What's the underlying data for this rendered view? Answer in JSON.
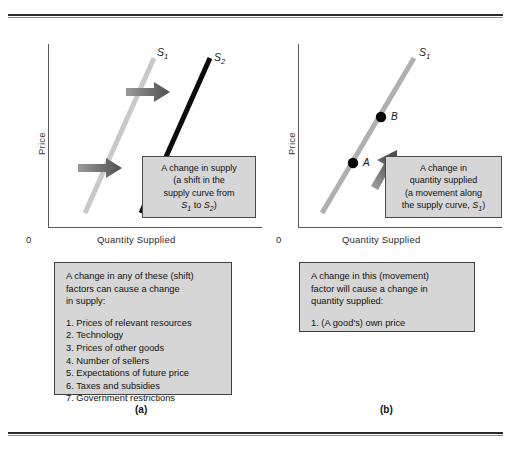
{
  "figure": {
    "panels": [
      {
        "id": "a",
        "caption": "(a)",
        "axes": {
          "origin": "0",
          "x_label": "Quantity Supplied",
          "y_label": "Price"
        },
        "curves": [
          {
            "name": "supply-curve-s1",
            "label": "S",
            "sub": "1",
            "color": "#c9c9c9"
          },
          {
            "name": "supply-curve-s2",
            "label": "S",
            "sub": "2",
            "color": "#000000"
          }
        ],
        "arrows": [
          {
            "name": "shift-arrow-upper",
            "direction": "right",
            "color": "#6e6e6e"
          },
          {
            "name": "shift-arrow-lower",
            "direction": "right",
            "color": "#6e6e6e"
          }
        ],
        "callout": {
          "line1": "A change in supply",
          "line2": "(a shift in the",
          "line3": "supply curve from",
          "line4_pre": "S",
          "line4_sub1": "1",
          "line4_mid": " to ",
          "line4_post": "S",
          "line4_sub2": "2",
          "line4_end": ")"
        },
        "listbox": {
          "intro_line1": "A change in any of these (shift)",
          "intro_line2": "factors can cause a change",
          "intro_line3": "in supply:",
          "items": [
            "1. Prices of relevant resources",
            "2. Technology",
            "3. Prices of other goods",
            "4. Number of sellers",
            "5. Expectations of future price",
            "6. Taxes and subsidies",
            "7. Government restrictions"
          ]
        }
      },
      {
        "id": "b",
        "caption": "(b)",
        "axes": {
          "origin": "0",
          "x_label": "Quantity Supplied",
          "y_label": "Price"
        },
        "curves": [
          {
            "name": "supply-curve-s1",
            "label": "S",
            "sub": "1",
            "color": "#b0b0b0"
          }
        ],
        "points": [
          {
            "name": "point-a",
            "label": "A"
          },
          {
            "name": "point-b",
            "label": "B"
          }
        ],
        "arrows": [
          {
            "name": "movement-arrow",
            "direction": "up-right",
            "color": "#6e6e6e"
          }
        ],
        "callout": {
          "line1": "A change in",
          "line2": "quantity supplied",
          "line3": "(a movement along",
          "line4_pre": "the supply curve, ",
          "line4_s": "S",
          "line4_sub": "1",
          "line4_end": ")"
        },
        "listbox": {
          "intro_line1": "A change in this (movement)",
          "intro_line2": "factor will cause a change in",
          "intro_line3": "quantity supplied:",
          "items": [
            "1. (A good's) own price"
          ]
        }
      }
    ]
  }
}
